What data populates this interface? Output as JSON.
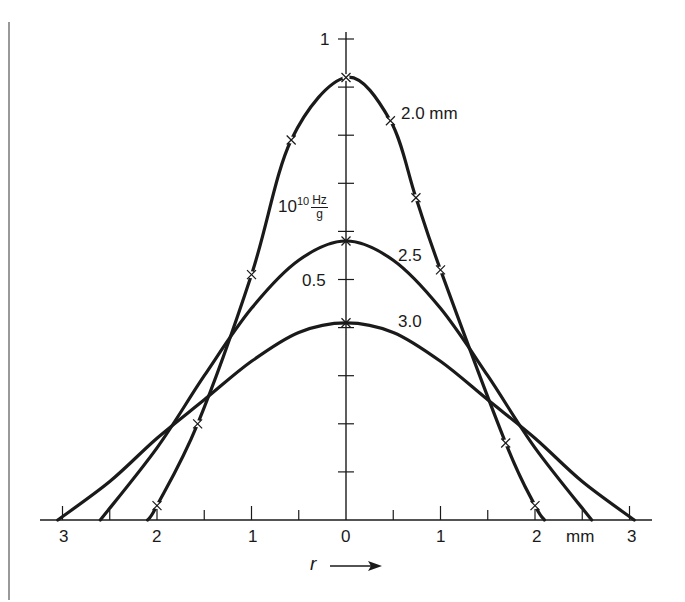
{
  "chart_data": {
    "type": "line",
    "title": "",
    "xlabel": "r",
    "xunit": "mm",
    "ylabel_unit": "10^10 Hz/g",
    "x_ticks": [
      -3,
      -2.5,
      -2,
      -1.5,
      -1,
      -0.5,
      0,
      0.5,
      1,
      1.5,
      2,
      2.5,
      3
    ],
    "x_tick_labels": [
      "3",
      "2",
      "1",
      "0",
      "1",
      "2",
      "3"
    ],
    "x_tick_label_positions": [
      -3,
      -2,
      -1,
      0,
      1,
      2,
      3
    ],
    "y_ticks": [
      0.1,
      0.2,
      0.3,
      0.4,
      0.5,
      0.6,
      0.7,
      0.8,
      0.9,
      1.0
    ],
    "y_tick_labels": {
      "0.5": "0.5",
      "1.0": "1"
    },
    "xlim": [
      -3.1,
      3.2
    ],
    "ylim": [
      0,
      1.0
    ],
    "grid": false,
    "legend": "inline curve labels",
    "series": [
      {
        "name": "2.0 mm",
        "label": "2.0 mm",
        "markers": true,
        "x": [
          -2.1,
          -2.0,
          -1.57,
          -1.0,
          -0.58,
          0,
          0.47,
          0.74,
          1.0,
          1.69,
          2.0,
          2.1
        ],
        "y": [
          0.0,
          0.03,
          0.2,
          0.51,
          0.79,
          0.92,
          0.83,
          0.67,
          0.52,
          0.16,
          0.03,
          0.0
        ],
        "marker_x": [
          -2.0,
          -1.57,
          -1.0,
          -0.58,
          0,
          0.47,
          0.74,
          1.0,
          1.69,
          2.0
        ]
      },
      {
        "name": "2.5",
        "label": "2.5",
        "markers": false,
        "x": [
          -2.6,
          -2.0,
          -1.5,
          -1.0,
          -0.5,
          0,
          0.5,
          1.0,
          1.5,
          2.0,
          2.6
        ],
        "y": [
          0.0,
          0.15,
          0.3,
          0.44,
          0.54,
          0.58,
          0.54,
          0.44,
          0.3,
          0.15,
          0.0
        ],
        "marker_x": [
          0
        ]
      },
      {
        "name": "3.0",
        "label": "3.0",
        "markers": false,
        "x": [
          -3.05,
          -2.5,
          -2.0,
          -1.5,
          -1.0,
          -0.5,
          0,
          0.5,
          1.0,
          1.5,
          2.0,
          2.5,
          3.05
        ],
        "y": [
          0.0,
          0.08,
          0.17,
          0.25,
          0.33,
          0.39,
          0.41,
          0.39,
          0.33,
          0.25,
          0.17,
          0.08,
          0.0
        ],
        "marker_x": [
          0
        ]
      }
    ]
  },
  "labels": {
    "y_one": "1",
    "y_half": "0.5",
    "unit_base": "10",
    "unit_exp": "10",
    "unit_num": "Hz",
    "unit_den": "g",
    "curve_20": "2.0 mm",
    "curve_25": "2.5",
    "curve_30": "3.0",
    "x_unit": "mm",
    "x_var": "r",
    "x_ticks": [
      "3",
      "2",
      "1",
      "0",
      "1",
      "2",
      "3"
    ]
  },
  "colors": {
    "ink": "#1a1a1a",
    "background": "#ffffff"
  }
}
